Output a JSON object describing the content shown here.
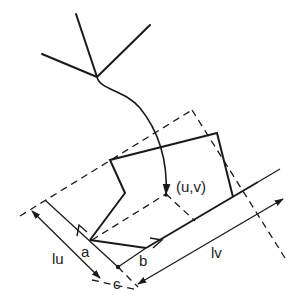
{
  "diagram": {
    "colors": {
      "stroke": "#1a1a1a",
      "background": "#ffffff",
      "text": "#222222"
    },
    "labels": {
      "uv_point": "(u,v)",
      "a": "a",
      "b": "b",
      "c": "c",
      "lu": "lu",
      "lv": "lv"
    }
  }
}
